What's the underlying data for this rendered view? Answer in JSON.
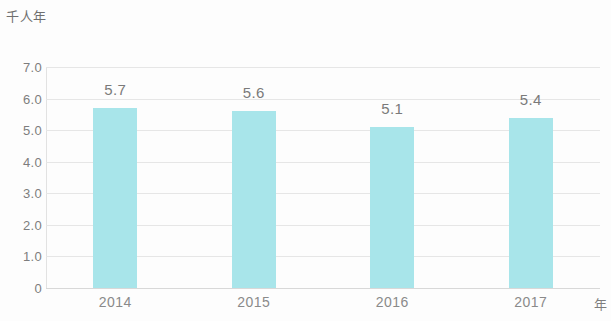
{
  "chart_data": {
    "type": "bar",
    "title": "",
    "subtitle": "",
    "xlabel": "年",
    "ylabel": "千人年",
    "categories": [
      "2014",
      "2015",
      "2016",
      "2017"
    ],
    "values": [
      5.7,
      5.6,
      5.1,
      5.4
    ],
    "data_labels": [
      "5.7",
      "5.6",
      "5.1",
      "5.4"
    ],
    "ylim": [
      0,
      7
    ],
    "ytick_labels": [
      "7.0",
      "6.0",
      "5.0",
      "4.0",
      "3.0",
      "2.0",
      "1.0",
      "0"
    ],
    "ytick_values": [
      7,
      6,
      5,
      4,
      3,
      2,
      1,
      0
    ],
    "grid": true,
    "grid_axis": "y",
    "legend": false,
    "legend_position": "none",
    "series": [
      {
        "name": "",
        "values": [
          5.7,
          5.6,
          5.1,
          5.4
        ],
        "color": "#a8e5ea"
      }
    ],
    "colors": {
      "bar": "#a8e5ea",
      "gridline": "#e6e6e6",
      "axis": "#d8d8d8",
      "tick_text": "#7d7d7d",
      "label_text": "#7a7a7a",
      "background": "#fdfdfd"
    }
  }
}
